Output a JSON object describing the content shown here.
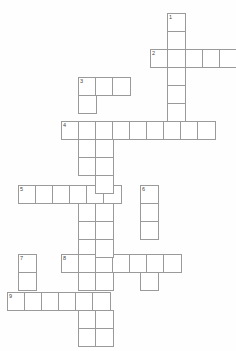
{
  "puzzle": {
    "title": "Crossword Puzzle Grid",
    "type": "crossword",
    "cell_size": 17.5,
    "grid_origin": {
      "x": 7,
      "y": 13
    },
    "background_color": "#fefefe",
    "cell_fill_color": "#ffffff",
    "cell_border_color": "#9a9a9a",
    "number_color": "#444444",
    "entries": [
      {
        "number": "1",
        "direction": "down",
        "length": 2,
        "col": 9,
        "row": 0
      },
      {
        "number": "2",
        "direction": "across",
        "length": 5,
        "col": 8,
        "row": 2
      },
      {
        "number": "3",
        "direction": "across",
        "length": 3,
        "col": 4,
        "row": 4
      },
      {
        "number": "3",
        "direction": "down",
        "length": 13,
        "col": 4,
        "row": 4
      },
      {
        "number": "4",
        "direction": "across",
        "length": 9,
        "col": 3,
        "row": 6
      },
      {
        "number": "5",
        "direction": "across",
        "length": 6,
        "col": 1,
        "row": 10
      },
      {
        "number": "6",
        "direction": "down",
        "length": 4,
        "col": 8,
        "row": 10
      },
      {
        "number": "7",
        "direction": "down",
        "length": 2,
        "col": 1,
        "row": 14
      },
      {
        "number": "8",
        "direction": "across",
        "length": 7,
        "col": 3,
        "row": 14
      },
      {
        "number": "9",
        "direction": "across",
        "length": 6,
        "col": 0,
        "row": 16
      }
    ],
    "cells": [
      {
        "x": 167,
        "y": 13,
        "num": "1"
      },
      {
        "x": 167,
        "y": 31,
        "num": ""
      },
      {
        "x": 150,
        "y": 49,
        "num": "2"
      },
      {
        "x": 167,
        "y": 49,
        "num": ""
      },
      {
        "x": 185,
        "y": 49,
        "num": ""
      },
      {
        "x": 202,
        "y": 49,
        "num": ""
      },
      {
        "x": 219,
        "y": 49,
        "num": ""
      },
      {
        "x": 167,
        "y": 67,
        "num": ""
      },
      {
        "x": 167,
        "y": 85,
        "num": ""
      },
      {
        "x": 167,
        "y": 103,
        "num": ""
      },
      {
        "x": 78,
        "y": 77,
        "num": "3"
      },
      {
        "x": 95,
        "y": 77,
        "num": ""
      },
      {
        "x": 112,
        "y": 77,
        "num": ""
      },
      {
        "x": 78,
        "y": 95,
        "num": ""
      },
      {
        "x": 61,
        "y": 121,
        "num": "4"
      },
      {
        "x": 78,
        "y": 121,
        "num": ""
      },
      {
        "x": 95,
        "y": 121,
        "num": ""
      },
      {
        "x": 112,
        "y": 121,
        "num": ""
      },
      {
        "x": 129,
        "y": 121,
        "num": ""
      },
      {
        "x": 146,
        "y": 121,
        "num": ""
      },
      {
        "x": 163,
        "y": 121,
        "num": ""
      },
      {
        "x": 180,
        "y": 121,
        "num": ""
      },
      {
        "x": 197,
        "y": 121,
        "num": ""
      },
      {
        "x": 78,
        "y": 139,
        "num": ""
      },
      {
        "x": 78,
        "y": 157,
        "num": ""
      },
      {
        "x": 18,
        "y": 185,
        "num": "5"
      },
      {
        "x": 35,
        "y": 185,
        "num": ""
      },
      {
        "x": 52,
        "y": 185,
        "num": ""
      },
      {
        "x": 69,
        "y": 185,
        "num": ""
      },
      {
        "x": 86,
        "y": 185,
        "num": ""
      },
      {
        "x": 103,
        "y": 185,
        "num": ""
      },
      {
        "x": 140,
        "y": 185,
        "num": "6"
      },
      {
        "x": 140,
        "y": 203,
        "num": ""
      },
      {
        "x": 140,
        "y": 221,
        "num": ""
      },
      {
        "x": 78,
        "y": 203,
        "num": ""
      },
      {
        "x": 78,
        "y": 221,
        "num": ""
      },
      {
        "x": 78,
        "y": 239,
        "num": ""
      },
      {
        "x": 18,
        "y": 254,
        "num": "7"
      },
      {
        "x": 18,
        "y": 272,
        "num": ""
      },
      {
        "x": 61,
        "y": 254,
        "num": "8"
      },
      {
        "x": 78,
        "y": 254,
        "num": ""
      },
      {
        "x": 95,
        "y": 254,
        "num": ""
      },
      {
        "x": 112,
        "y": 254,
        "num": ""
      },
      {
        "x": 129,
        "y": 254,
        "num": ""
      },
      {
        "x": 146,
        "y": 254,
        "num": ""
      },
      {
        "x": 163,
        "y": 254,
        "num": ""
      },
      {
        "x": 140,
        "y": 272,
        "num": ""
      },
      {
        "x": 7,
        "y": 292,
        "num": "9"
      },
      {
        "x": 24,
        "y": 292,
        "num": ""
      },
      {
        "x": 41,
        "y": 292,
        "num": ""
      },
      {
        "x": 58,
        "y": 292,
        "num": ""
      },
      {
        "x": 75,
        "y": 292,
        "num": ""
      },
      {
        "x": 92,
        "y": 292,
        "num": ""
      },
      {
        "x": 78,
        "y": 272,
        "num": ""
      },
      {
        "x": 78,
        "y": 310,
        "num": ""
      },
      {
        "x": 78,
        "y": 328,
        "num": ""
      },
      {
        "x": 95,
        "y": 139,
        "num": ""
      },
      {
        "x": 95,
        "y": 157,
        "num": ""
      },
      {
        "x": 95,
        "y": 175,
        "num": ""
      },
      {
        "x": 95,
        "y": 203,
        "num": ""
      },
      {
        "x": 95,
        "y": 221,
        "num": ""
      },
      {
        "x": 95,
        "y": 239,
        "num": ""
      },
      {
        "x": 95,
        "y": 272,
        "num": ""
      },
      {
        "x": 95,
        "y": 310,
        "num": ""
      },
      {
        "x": 95,
        "y": 328,
        "num": ""
      }
    ]
  }
}
